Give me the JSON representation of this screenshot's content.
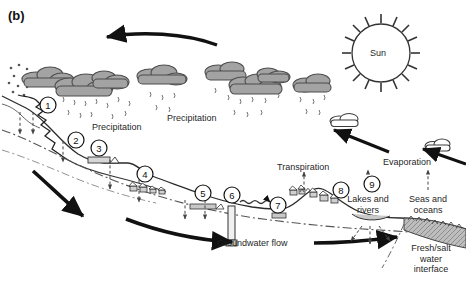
{
  "figure": {
    "panel_tag": "(b)",
    "background_color": "#ffffff",
    "width": 466,
    "height": 286
  },
  "colors": {
    "cloud_fill": "#a3a3a3",
    "cloud_stroke": "#4d4d4d",
    "ink": "#1a1a1a",
    "arrow_black": "#111111",
    "ground_line": "#2b2b2b",
    "watertable_dashdot": "#555555",
    "sea_fill": "#bdbdbd",
    "building_fill": "#d6d6d6"
  },
  "labels": [
    {
      "id": "precipitation-left",
      "text": "Precipitation",
      "x": 92,
      "y": 127
    },
    {
      "id": "precipitation-right",
      "text": "Precipitation",
      "x": 167,
      "y": 119
    },
    {
      "id": "sun",
      "text": "Sun",
      "x": 381,
      "y": 53
    },
    {
      "id": "evaporation",
      "text": "Evaporation",
      "x": 412,
      "y": 163
    },
    {
      "id": "transpiration",
      "text": "Transpiration",
      "x": 304,
      "y": 168
    },
    {
      "id": "groundwater-flow",
      "text": "Groundwater flow",
      "x": 255,
      "y": 243
    },
    {
      "id": "lakes-and-rivers",
      "text": "Lakes and rivers",
      "x": 368,
      "y": 200
    },
    {
      "id": "seas-and-oceans",
      "text": "Seas and oceans",
      "x": 428,
      "y": 200
    },
    {
      "id": "fresh-salt-interface",
      "text": "Fresh/salt water interface",
      "x": 432,
      "y": 248
    }
  ],
  "callouts": [
    {
      "n": "1",
      "x": 48,
      "y": 105,
      "name": "callout-1-snowmelt"
    },
    {
      "n": "2",
      "x": 76,
      "y": 140,
      "name": "callout-2-runoff"
    },
    {
      "n": "3",
      "x": 99,
      "y": 162,
      "name": "callout-3-upland-abstraction"
    },
    {
      "n": "4",
      "x": 145,
      "y": 178,
      "name": "callout-4-village"
    },
    {
      "n": "5",
      "x": 203,
      "y": 195,
      "name": "callout-5-spring"
    },
    {
      "n": "6",
      "x": 232,
      "y": 196,
      "name": "callout-6-well"
    },
    {
      "n": "7",
      "x": 278,
      "y": 207,
      "name": "callout-7-lowland-supply"
    },
    {
      "n": "8",
      "x": 339,
      "y": 194,
      "name": "callout-8-settlement"
    },
    {
      "n": "9",
      "x": 372,
      "y": 185,
      "name": "callout-9-surface-water"
    }
  ],
  "elements": {
    "sun": {
      "cx": 381,
      "cy": 53,
      "r": 29,
      "rays": 12
    },
    "clouds_gray": [
      {
        "cx": 45,
        "cy": 78,
        "w": 38,
        "h": 17
      },
      {
        "cx": 78,
        "cy": 84,
        "w": 44,
        "h": 20
      },
      {
        "cx": 108,
        "cy": 81,
        "w": 33,
        "h": 15
      },
      {
        "cx": 160,
        "cy": 76,
        "w": 36,
        "h": 16
      },
      {
        "cx": 228,
        "cy": 71,
        "w": 36,
        "h": 16
      },
      {
        "cx": 250,
        "cy": 84,
        "w": 40,
        "h": 18
      },
      {
        "cx": 276,
        "cy": 74,
        "w": 30,
        "h": 14
      },
      {
        "cx": 313,
        "cy": 84,
        "w": 32,
        "h": 15
      }
    ],
    "clouds_white": [
      {
        "cx": 345,
        "cy": 122,
        "w": 26,
        "h": 11,
        "name": "cloud-white-vapor-upper"
      },
      {
        "cx": 438,
        "cy": 146,
        "w": 24,
        "h": 10,
        "name": "cloud-white-vapor-lower"
      }
    ],
    "black_arrows": [
      {
        "name": "arrow-atmospheric-transport-westward",
        "from": [
          217,
          44
        ],
        "to": [
          104,
          37
        ]
      },
      {
        "name": "arrow-vapor-rise-to-cloud",
        "from": [
          386,
          150
        ],
        "to": [
          330,
          129
        ]
      },
      {
        "name": "arrow-vapor-inland",
        "from": [
          466,
          163
        ],
        "to": [
          420,
          147
        ]
      },
      {
        "name": "arrow-groundwater-upper-left",
        "from": [
          33,
          170
        ],
        "to": [
          86,
          218
        ]
      },
      {
        "name": "arrow-groundwater-mid",
        "from": [
          128,
          219
        ],
        "to": [
          235,
          241
        ]
      },
      {
        "name": "arrow-groundwater-lower-right",
        "from": [
          315,
          242
        ],
        "to": [
          400,
          236
        ]
      }
    ],
    "dashed_arrows_infiltration": [
      {
        "x": 20,
        "y1": 113,
        "y2": 135
      },
      {
        "x": 33,
        "y1": 113,
        "y2": 135
      },
      {
        "x": 63,
        "y1": 142,
        "y2": 163
      },
      {
        "x": 110,
        "y1": 160,
        "y2": 190
      },
      {
        "x": 139,
        "y1": 180,
        "y2": 203
      },
      {
        "x": 185,
        "y1": 200,
        "y2": 220
      },
      {
        "x": 205,
        "y1": 200,
        "y2": 220
      }
    ],
    "dashed_arrows_up": [
      {
        "name": "transpiration-arrow",
        "x": 304,
        "y1": 188,
        "y2": 172
      },
      {
        "name": "evaporation-lake-arrow",
        "x": 368,
        "y1": 188,
        "y2": 170
      },
      {
        "name": "evaporation-sea-arrow",
        "x": 428,
        "y1": 188,
        "y2": 170
      }
    ],
    "dashed_arrows_lake_recharge": [
      {
        "from": [
          363,
          226
        ],
        "to": [
          352,
          241
        ]
      },
      {
        "from": [
          370,
          226
        ],
        "to": [
          370,
          243
        ]
      },
      {
        "from": [
          378,
          226
        ],
        "to": [
          389,
          241
        ]
      }
    ],
    "rain_count": 26
  }
}
